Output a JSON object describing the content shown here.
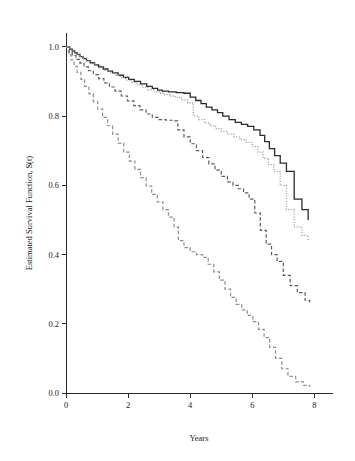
{
  "figure": {
    "background": "#ffffff",
    "plot_area": {
      "left": 66,
      "top": 33,
      "right": 333,
      "bottom": 393
    }
  },
  "chart_data": {
    "type": "line",
    "subtype": "kaplan-meier-step",
    "title": "",
    "xlabel": "Years",
    "ylabel": "Estimated Survival Function, S(t)",
    "xlim": [
      0,
      8.6
    ],
    "ylim": [
      0.0,
      1.04
    ],
    "xticks": [
      0,
      2,
      4,
      6,
      8
    ],
    "xtick_labels": [
      "0",
      "2",
      "4",
      "6",
      "8"
    ],
    "yticks": [
      0.0,
      0.2,
      0.4,
      0.6,
      0.8,
      1.0
    ],
    "ytick_labels": [
      "0.0",
      "0.2",
      "0.4",
      "0.6",
      "0.8",
      "1.0"
    ],
    "grid": false,
    "legend": false,
    "legend_position": "none",
    "series": [
      {
        "name": "group-1-solid-black",
        "style": "solid",
        "color": "#2b2b2b",
        "width": 1.3,
        "end_value": 0.5,
        "x": [
          0.0,
          0.12,
          0.2,
          0.28,
          0.36,
          0.45,
          0.55,
          0.66,
          0.78,
          0.92,
          1.05,
          1.2,
          1.35,
          1.5,
          1.68,
          1.85,
          2.02,
          2.2,
          2.4,
          2.6,
          2.78,
          2.95,
          3.1,
          3.3,
          3.55,
          3.8,
          4.0,
          4.18,
          4.35,
          4.52,
          4.7,
          4.88,
          5.05,
          5.25,
          5.45,
          5.65,
          5.85,
          6.05,
          6.25,
          6.4,
          6.55,
          6.72,
          6.9,
          7.1,
          7.35,
          7.6,
          7.8
        ],
        "y": [
          1.0,
          0.993,
          0.988,
          0.983,
          0.978,
          0.972,
          0.966,
          0.96,
          0.954,
          0.948,
          0.942,
          0.936,
          0.93,
          0.925,
          0.918,
          0.912,
          0.906,
          0.9,
          0.893,
          0.886,
          0.88,
          0.875,
          0.872,
          0.87,
          0.868,
          0.866,
          0.855,
          0.845,
          0.836,
          0.826,
          0.818,
          0.81,
          0.8,
          0.79,
          0.782,
          0.776,
          0.77,
          0.76,
          0.744,
          0.726,
          0.706,
          0.686,
          0.664,
          0.64,
          0.56,
          0.53,
          0.5
        ]
      },
      {
        "name": "group-2-dotted-gray",
        "style": "dotted",
        "color": "#9a9a9a",
        "width": 1.3,
        "end_value": 0.44,
        "x": [
          0.0,
          0.12,
          0.22,
          0.32,
          0.42,
          0.54,
          0.66,
          0.8,
          0.95,
          1.1,
          1.26,
          1.42,
          1.58,
          1.75,
          1.92,
          2.1,
          2.28,
          2.46,
          2.64,
          2.82,
          3.0,
          3.18,
          3.35,
          3.52,
          3.72,
          3.92,
          4.1,
          4.28,
          4.46,
          4.64,
          4.82,
          5.0,
          5.2,
          5.4,
          5.6,
          5.8,
          6.0,
          6.18,
          6.35,
          6.52,
          6.7,
          6.9,
          7.1,
          7.35,
          7.6,
          7.8
        ],
        "y": [
          1.0,
          0.991,
          0.985,
          0.979,
          0.973,
          0.967,
          0.96,
          0.953,
          0.946,
          0.939,
          0.932,
          0.925,
          0.918,
          0.911,
          0.904,
          0.897,
          0.89,
          0.883,
          0.876,
          0.87,
          0.866,
          0.862,
          0.858,
          0.854,
          0.846,
          0.838,
          0.8,
          0.79,
          0.78,
          0.772,
          0.764,
          0.756,
          0.748,
          0.74,
          0.732,
          0.724,
          0.712,
          0.696,
          0.678,
          0.66,
          0.64,
          0.6,
          0.53,
          0.48,
          0.455,
          0.44
        ]
      },
      {
        "name": "group-3-dashed-dark",
        "style": "dashed",
        "color": "#5c5c5c",
        "width": 1.2,
        "end_value": 0.26,
        "x": [
          0.0,
          0.1,
          0.2,
          0.32,
          0.45,
          0.58,
          0.72,
          0.88,
          1.05,
          1.22,
          1.4,
          1.58,
          1.78,
          1.98,
          2.18,
          2.38,
          2.58,
          2.78,
          3.0,
          3.22,
          3.42,
          3.6,
          3.8,
          4.0,
          4.2,
          4.4,
          4.6,
          4.8,
          5.0,
          5.2,
          5.38,
          5.55,
          5.72,
          5.9,
          6.08,
          6.26,
          6.45,
          6.62,
          6.8,
          7.0,
          7.22,
          7.45,
          7.7,
          7.85
        ],
        "y": [
          1.0,
          0.985,
          0.975,
          0.964,
          0.953,
          0.942,
          0.931,
          0.92,
          0.908,
          0.896,
          0.884,
          0.872,
          0.858,
          0.844,
          0.83,
          0.818,
          0.806,
          0.796,
          0.79,
          0.788,
          0.786,
          0.76,
          0.74,
          0.72,
          0.7,
          0.68,
          0.662,
          0.644,
          0.626,
          0.61,
          0.6,
          0.59,
          0.578,
          0.56,
          0.52,
          0.47,
          0.43,
          0.4,
          0.38,
          0.34,
          0.31,
          0.29,
          0.268,
          0.26
        ]
      },
      {
        "name": "group-4-dashed-light",
        "style": "dashed",
        "color": "#8d8d8d",
        "width": 1.2,
        "end_value": 0.02,
        "x": [
          0.0,
          0.08,
          0.16,
          0.26,
          0.36,
          0.48,
          0.6,
          0.74,
          0.88,
          1.02,
          1.18,
          1.34,
          1.5,
          1.68,
          1.86,
          2.04,
          2.22,
          2.4,
          2.58,
          2.76,
          2.94,
          3.12,
          3.3,
          3.48,
          3.62,
          3.8,
          4.0,
          4.2,
          4.4,
          4.58,
          4.76,
          4.94,
          5.12,
          5.3,
          5.48,
          5.66,
          5.84,
          6.02,
          6.2,
          6.38,
          6.56,
          6.75,
          6.95,
          7.15,
          7.4,
          7.65,
          7.85
        ],
        "y": [
          1.0,
          0.978,
          0.962,
          0.944,
          0.926,
          0.906,
          0.886,
          0.864,
          0.842,
          0.82,
          0.796,
          0.772,
          0.748,
          0.722,
          0.696,
          0.67,
          0.646,
          0.622,
          0.598,
          0.574,
          0.552,
          0.53,
          0.508,
          0.48,
          0.44,
          0.42,
          0.408,
          0.4,
          0.392,
          0.372,
          0.35,
          0.326,
          0.3,
          0.276,
          0.256,
          0.24,
          0.224,
          0.206,
          0.184,
          0.16,
          0.132,
          0.1,
          0.07,
          0.048,
          0.032,
          0.022,
          0.018
        ]
      }
    ]
  }
}
